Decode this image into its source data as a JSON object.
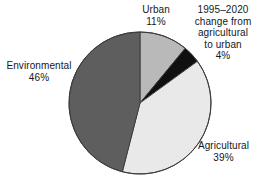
{
  "chart_data": {
    "type": "pie",
    "title": "",
    "subtitle": "",
    "xlabel": "",
    "ylabel": "",
    "legend_position": "callout-labels",
    "grid": false,
    "units": "percent",
    "center": {
      "x": 140,
      "y": 103
    },
    "radius": 71,
    "start_angle_deg": 0,
    "direction": "clockwise",
    "categories": [
      "Urban",
      "1995–2020 change from agricultural to urban",
      "Agricultural",
      "Environmental"
    ],
    "values": [
      11,
      4,
      39,
      46
    ],
    "colors": [
      "#b9b9b9",
      "#101010",
      "#e9e9e9",
      "#5e5e5e"
    ],
    "slices": [
      {
        "name": "Urban",
        "value": 11,
        "value_label": "11%",
        "color": "#b9b9b9",
        "start_deg": 0,
        "end_deg": 39.6
      },
      {
        "name": "1995–2020 change from agricultural to urban",
        "value": 4,
        "value_label": "4%",
        "color": "#101010",
        "start_deg": 39.6,
        "end_deg": 54.0
      },
      {
        "name": "Agricultural",
        "value": 39,
        "value_label": "39%",
        "color": "#e9e9e9",
        "start_deg": 54.0,
        "end_deg": 194.4
      },
      {
        "name": "Environmental",
        "value": 46,
        "value_label": "46%",
        "color": "#5e5e5e",
        "start_deg": 194.4,
        "end_deg": 360.0
      }
    ]
  },
  "labels": {
    "urban": {
      "line1": "Urban",
      "line2": "11%"
    },
    "change": {
      "line1": "1995–2020",
      "line2": "change from",
      "line3": "agricultural",
      "line4": "to urban",
      "line5": "4%"
    },
    "environmental": {
      "line1": "Environmental",
      "line2": "46%"
    },
    "agricultural": {
      "line1": "Agricultural",
      "line2": "39%"
    }
  },
  "style": {
    "background": "#ffffff",
    "outline": "#3a3a3a",
    "text": "#15181c"
  }
}
